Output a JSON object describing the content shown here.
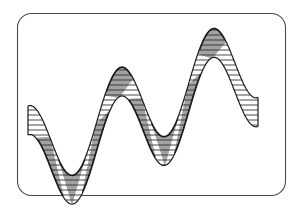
{
  "figure": {
    "title": "Hatched sinusoidal ribbon with upward linear trend",
    "canvas": {
      "width": 301,
      "height": 213
    },
    "background_color": "#ffffff"
  },
  "frame": {
    "name": "rounded-rectangle-border",
    "x": 17,
    "y": 13,
    "width": 268,
    "height": 182,
    "corner_radius": 14,
    "stroke_color": "#4a4a4a",
    "stroke_width": 1.1,
    "fill_color": "#ffffff"
  },
  "ribbon": {
    "name": "hatched-sine-band",
    "outline_color": "#1c1c1c",
    "outline_width": 1.2,
    "hatch_color": "#2b2b2b",
    "hatch_width": 0.85,
    "hatch_spacing": 5,
    "band_thickness": 29,
    "fill_color": "#ffffff",
    "shade_color": "#9a9a9a",
    "shade_dark_color": "#6f6f6f",
    "crest_edge_color": "#111111"
  },
  "chart_data": {
    "type": "line",
    "title": "Hatched sinusoidal ribbon with upward linear trend",
    "xlabel": "",
    "ylabel": "",
    "grid": false,
    "legend": "none",
    "xlim": [
      28,
      258
    ],
    "ylim": [
      22,
      178
    ],
    "wave": {
      "form": "sine",
      "amplitude_px": 44,
      "period_px": 92,
      "phase_deg": 270,
      "trend_slope": -0.42,
      "trend_intercept_px": 150,
      "x_start": 28,
      "x_end": 258,
      "band_offset_px": 29,
      "cycles": 2.5
    },
    "extrema": [
      {
        "kind": "trough",
        "x": 50,
        "y": 166
      },
      {
        "kind": "peak",
        "x": 72,
        "y": 108
      },
      {
        "kind": "trough",
        "x": 96,
        "y": 147
      },
      {
        "kind": "peak",
        "x": 119,
        "y": 70
      },
      {
        "kind": "trough",
        "x": 142,
        "y": 128
      },
      {
        "kind": "peak",
        "x": 165,
        "y": 51
      },
      {
        "kind": "trough",
        "x": 188,
        "y": 108
      },
      {
        "kind": "peak",
        "x": 212,
        "y": 31
      },
      {
        "kind": "trough",
        "x": 235,
        "y": 89
      }
    ],
    "shaded_wedges": [
      {
        "at": "trough",
        "x": 50,
        "orientation": "apex-up"
      },
      {
        "at": "peak",
        "x": 72,
        "orientation": "apex-down"
      },
      {
        "at": "trough",
        "x": 96,
        "orientation": "apex-up"
      },
      {
        "at": "peak",
        "x": 119,
        "orientation": "apex-down"
      },
      {
        "at": "trough",
        "x": 142,
        "orientation": "apex-up"
      },
      {
        "at": "peak",
        "x": 165,
        "orientation": "apex-down"
      },
      {
        "at": "trough",
        "x": 188,
        "orientation": "apex-up"
      },
      {
        "at": "peak",
        "x": 212,
        "orientation": "apex-down"
      }
    ]
  }
}
